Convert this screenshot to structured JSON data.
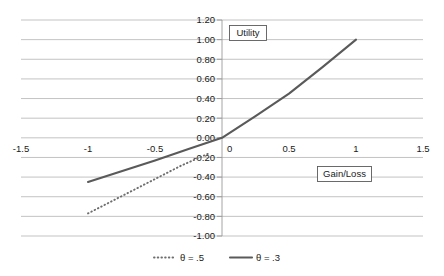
{
  "chart_data": {
    "type": "line",
    "title": "",
    "xlabel": "Gain/Loss",
    "ylabel": "Utility",
    "xlim": [
      -1.5,
      1.5
    ],
    "ylim": [
      -1.0,
      1.2
    ],
    "grid": true,
    "legend_position": "bottom",
    "x_ticks": [
      "-1.5",
      "-1",
      "-0.5",
      "0",
      "0.5",
      "1",
      "1.5"
    ],
    "x_tick_values": [
      -1.5,
      -1,
      -0.5,
      0,
      0.5,
      1,
      1.5
    ],
    "y_ticks": [
      "1.20",
      "1.00",
      "0.80",
      "0.60",
      "0.40",
      "0.20",
      "0.00",
      "-0.20",
      "-0.40",
      "-0.60",
      "-0.80",
      "-1.00"
    ],
    "y_tick_values": [
      1.2,
      1.0,
      0.8,
      0.6,
      0.4,
      0.2,
      0.0,
      -0.2,
      -0.4,
      -0.6,
      -0.8,
      -1.0
    ],
    "series": [
      {
        "name": "θ = .5",
        "style": "dotted",
        "color": "#6e6e6e",
        "x": [
          -1.0,
          -0.9,
          -0.8,
          -0.7,
          -0.6,
          -0.5,
          -0.4,
          -0.3,
          -0.2,
          -0.1
        ],
        "values": [
          -0.77,
          -0.7,
          -0.63,
          -0.56,
          -0.49,
          -0.42,
          -0.35,
          -0.28,
          -0.22,
          -0.16
        ]
      },
      {
        "name": "θ = .3",
        "style": "solid",
        "color": "#5a5a5a",
        "x": [
          -1.0,
          -0.75,
          -0.5,
          -0.25,
          0.0,
          0.25,
          0.5,
          0.75,
          1.0
        ],
        "values": [
          -0.45,
          -0.34,
          -0.23,
          -0.115,
          0.0,
          0.22,
          0.45,
          0.72,
          1.0
        ]
      }
    ]
  },
  "axis_labels": {
    "y_box": "Utility",
    "x_box": "Gain/Loss"
  },
  "legend": {
    "items": [
      {
        "label": "θ = .5",
        "marker": "dotted-line-marker"
      },
      {
        "label": "θ = .3",
        "marker": "solid-line-marker"
      }
    ]
  },
  "colors": {
    "grid": "#a9a9a9",
    "axis": "#9a9a9a",
    "series_solid": "#5a5a5a",
    "series_dotted": "#6e6e6e",
    "text": "#1a1a1a",
    "background": "#ffffff"
  }
}
